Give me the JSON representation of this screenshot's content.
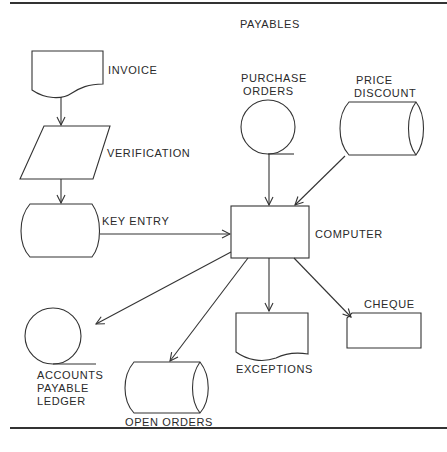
{
  "diagram": {
    "title": "PAYABLES",
    "type": "system flowchart",
    "nodes": {
      "invoice": {
        "label": "INVOICE",
        "shape": "document"
      },
      "verification": {
        "label": "VERIFICATION",
        "shape": "parallelogram (input/output)"
      },
      "key_entry": {
        "label": "KEY ENTRY",
        "shape": "offline storage / keying"
      },
      "purchase_orders": {
        "label_line1": "PURCHASE",
        "label_line2": "ORDERS",
        "shape": "magnetic tape"
      },
      "price_discount": {
        "label_line1": "PRICE",
        "label_line2": "DISCOUNT",
        "shape": "magnetic drum"
      },
      "computer": {
        "label": "COMPUTER",
        "shape": "process rectangle"
      },
      "accounts_payable_ledger": {
        "label_line1": "ACCOUNTS",
        "label_line2": "PAYABLE",
        "label_line3": "LEDGER",
        "shape": "magnetic tape"
      },
      "open_orders": {
        "label": "OPEN ORDERS",
        "shape": "magnetic drum"
      },
      "exceptions": {
        "label": "EXCEPTIONS",
        "shape": "document"
      },
      "cheque": {
        "label": "CHEQUE",
        "shape": "punched card"
      }
    },
    "edges": [
      {
        "from": "INVOICE",
        "to": "VERIFICATION"
      },
      {
        "from": "VERIFICATION",
        "to": "KEY ENTRY"
      },
      {
        "from": "KEY ENTRY",
        "to": "COMPUTER"
      },
      {
        "from": "PURCHASE ORDERS",
        "to": "COMPUTER"
      },
      {
        "from": "PRICE DISCOUNT",
        "to": "COMPUTER"
      },
      {
        "from": "COMPUTER",
        "to": "ACCOUNTS PAYABLE LEDGER"
      },
      {
        "from": "COMPUTER",
        "to": "OPEN ORDERS"
      },
      {
        "from": "COMPUTER",
        "to": "EXCEPTIONS"
      },
      {
        "from": "COMPUTER",
        "to": "CHEQUE"
      }
    ],
    "colors": {
      "ink": "#333333",
      "background": "#ffffff"
    }
  }
}
